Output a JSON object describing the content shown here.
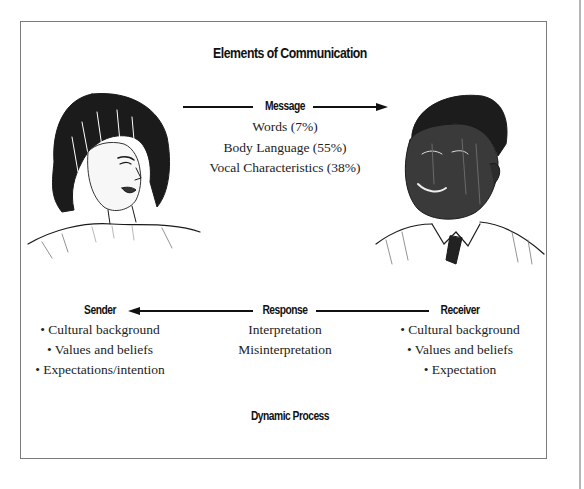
{
  "diagram": {
    "title": "Elements of Communication",
    "message": {
      "label": "Message",
      "items": [
        "Words (7%)",
        "Body Language (55%)",
        "Vocal Characteristics (38%)"
      ]
    },
    "response": {
      "label": "Response",
      "items": [
        "Interpretation",
        "Misinterpretation"
      ]
    },
    "sender": {
      "label": "Sender",
      "items": [
        "• Cultural background",
        "• Values and beliefs",
        "• Expectations/intention"
      ]
    },
    "receiver": {
      "label": "Receiver",
      "items": [
        "• Cultural background",
        "• Values and beliefs",
        "• Expectation"
      ]
    },
    "footer": "Dynamic Process",
    "illustrations": {
      "left": "woman-sketch",
      "right": "man-sketch"
    },
    "colors": {
      "ink": "#111111",
      "frame": "#7a7a7a",
      "rule": "#b4b4b4"
    }
  }
}
